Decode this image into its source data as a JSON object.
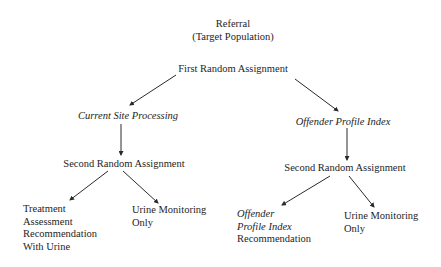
{
  "diagram": {
    "type": "flowchart-tree",
    "root": {
      "line1": "Referral",
      "line2": "(Target Population)"
    },
    "first_assignment": "First Random Assignment",
    "branches": {
      "left": {
        "label": "Current Site Processing",
        "label_style": "italic",
        "second_assignment": "Second Random Assignment",
        "leaves": [
          {
            "lines": [
              "Treatment",
              "Assessment",
              "Recommendation",
              "With Urine"
            ],
            "italic_lines": []
          },
          {
            "lines": [
              "Urine Monitoring",
              "Only"
            ],
            "italic_lines": []
          }
        ]
      },
      "right": {
        "label": "Offender Profile Index",
        "label_style": "italic",
        "second_assignment": "Second Random Assignment",
        "leaves": [
          {
            "lines": [
              "Offender",
              "Profile Index",
              "Recommendation"
            ],
            "italic_lines": [
              0,
              1
            ]
          },
          {
            "lines": [
              "Urine Monitoring",
              "Only"
            ],
            "italic_lines": []
          }
        ]
      }
    },
    "edges": [
      {
        "from": "First Random Assignment",
        "to": "Current Site Processing"
      },
      {
        "from": "First Random Assignment",
        "to": "Offender Profile Index"
      },
      {
        "from": "Current Site Processing",
        "to": "Second Random Assignment (left)"
      },
      {
        "from": "Offender Profile Index",
        "to": "Second Random Assignment (right)"
      },
      {
        "from": "Second Random Assignment (left)",
        "to": "Treatment Assessment Recommendation With Urine"
      },
      {
        "from": "Second Random Assignment (left)",
        "to": "Urine Monitoring Only (left)"
      },
      {
        "from": "Second Random Assignment (right)",
        "to": "Offender Profile Index Recommendation"
      },
      {
        "from": "Second Random Assignment (right)",
        "to": "Urine Monitoring Only (right)"
      }
    ],
    "colors": {
      "text": "#1e1e1e",
      "lines": "#2a2a2a",
      "background": "#ffffff"
    }
  }
}
